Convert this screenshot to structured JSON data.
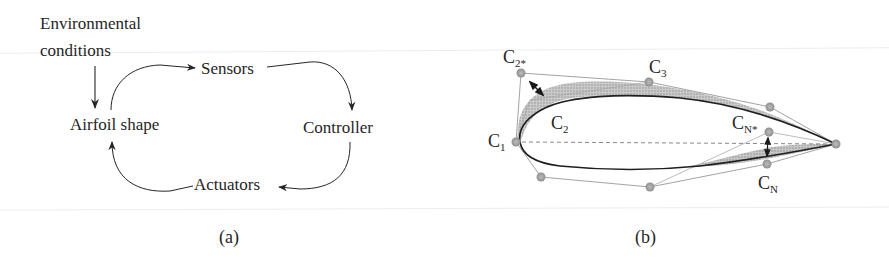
{
  "panel_a": {
    "caption": "(a)",
    "nodes": {
      "environment_line1": "Environmental",
      "environment_line2": "conditions",
      "airfoil": "Airfoil shape",
      "sensors": "Sensors",
      "controller": "Controller",
      "actuators": "Actuators"
    },
    "edges": [
      {
        "from": "Environmental conditions",
        "to": "Airfoil shape"
      },
      {
        "from": "Airfoil shape",
        "to": "Sensors"
      },
      {
        "from": "Sensors",
        "to": "Controller"
      },
      {
        "from": "Controller",
        "to": "Actuators"
      },
      {
        "from": "Actuators",
        "to": "Airfoil shape"
      }
    ]
  },
  "panel_b": {
    "caption": "(b)",
    "control_points": {
      "c1": {
        "base": "C",
        "sub": "1"
      },
      "c2": {
        "base": "C",
        "sub": "2"
      },
      "c2_star": {
        "base": "C",
        "sub": "2*"
      },
      "c3": {
        "base": "C",
        "sub": "3"
      },
      "cn": {
        "base": "C",
        "sub": "N"
      },
      "cn_star": {
        "base": "C",
        "sub": "N*"
      }
    }
  },
  "colors": {
    "ink": "#262626",
    "shade": "#9a9a9a",
    "control_point": "#a8a8a8",
    "polygon_line": "#8c8c8c"
  }
}
